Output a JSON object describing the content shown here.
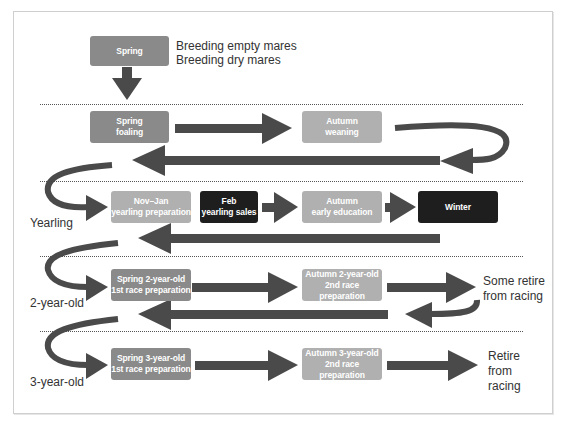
{
  "diagram": {
    "top": {
      "box": "Spring",
      "note_lines": [
        "Breeding empty mares",
        "Breeding dry mares"
      ]
    },
    "row_foal": {
      "boxes": [
        {
          "line1": "Spring",
          "line2": "foaling"
        },
        {
          "line1": "Autumn",
          "line2": "weaning"
        }
      ]
    },
    "row_yearling": {
      "label": "Yearling",
      "boxes": [
        {
          "line1": "Nov–Jan",
          "line2": "yearling preparation"
        },
        {
          "line1": "Feb",
          "line2": "yearling sales"
        },
        {
          "line1": "Autumn",
          "line2": "early education"
        },
        {
          "line1": "Winter",
          "line2": ""
        }
      ]
    },
    "row_2yo": {
      "label": "2-year-old",
      "boxes": [
        {
          "line1": "Spring 2-year-old",
          "line2": "1st race preparation"
        },
        {
          "line1": "Autumn 2-year-old",
          "line2": "2nd race preparation"
        }
      ],
      "outcome_lines": [
        "Some retire",
        "from racing"
      ]
    },
    "row_3yo": {
      "label": "3-year-old",
      "boxes": [
        {
          "line1": "Spring 3-year-old",
          "line2": "1st race preparation"
        },
        {
          "line1": "Autumn 3-year-old",
          "line2": "2nd race preparation"
        }
      ],
      "outcome_lines": [
        "Retire",
        "from",
        "racing"
      ]
    },
    "colors": {
      "box_mid": "#8a8a8a",
      "box_light": "#b0b0b0",
      "box_dark": "#1e1e1e",
      "arrow": "#4a4a4a"
    }
  }
}
